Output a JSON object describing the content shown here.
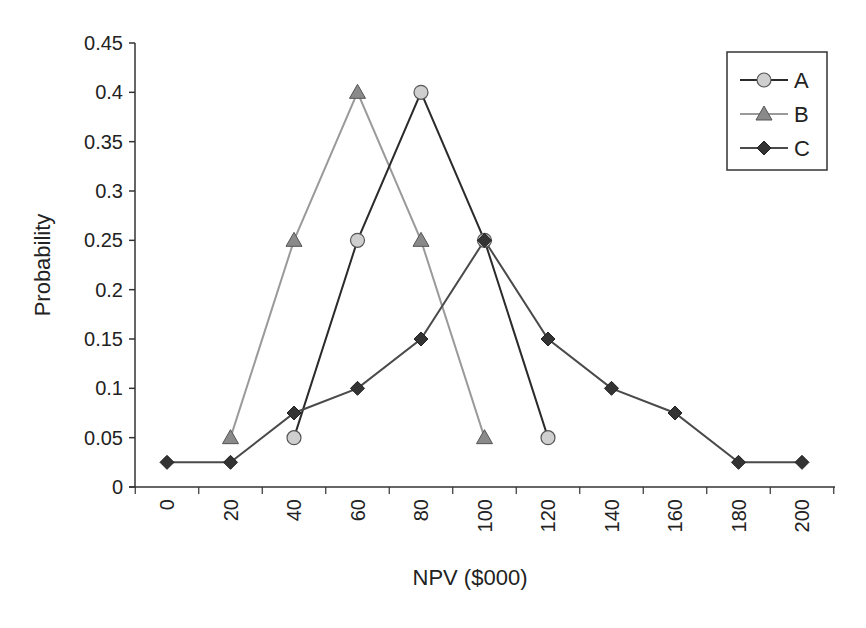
{
  "chart_data": {
    "type": "line",
    "title": "",
    "xlabel": "NPV ($000)",
    "ylabel": "Probability",
    "x": [
      0,
      20,
      40,
      60,
      80,
      100,
      120,
      140,
      160,
      180,
      200
    ],
    "xticks": [
      "0",
      "20",
      "40",
      "60",
      "80",
      "100",
      "120",
      "140",
      "160",
      "180",
      "200"
    ],
    "yticks": [
      "0",
      "0.05",
      "0.1",
      "0.15",
      "0.2",
      "0.25",
      "0.3",
      "0.35",
      "0.4",
      "0.45"
    ],
    "ylim": [
      0,
      0.45
    ],
    "xlim": [
      0,
      200
    ],
    "grid": false,
    "legend_position": "upper right",
    "series": [
      {
        "name": "A",
        "marker": "circle",
        "line_color": "#2b2b2b",
        "marker_fill": "#cfcfcf",
        "points": [
          [
            40,
            0.05
          ],
          [
            60,
            0.25
          ],
          [
            80,
            0.4
          ],
          [
            100,
            0.25
          ],
          [
            120,
            0.05
          ]
        ]
      },
      {
        "name": "B",
        "marker": "triangle",
        "line_color": "#9a9a9a",
        "marker_fill": "#8a8a8a",
        "points": [
          [
            20,
            0.05
          ],
          [
            40,
            0.25
          ],
          [
            60,
            0.4
          ],
          [
            80,
            0.25
          ],
          [
            100,
            0.05
          ]
        ]
      },
      {
        "name": "C",
        "marker": "diamond",
        "line_color": "#4a4a4a",
        "marker_fill": "#333333",
        "points": [
          [
            0,
            0.025
          ],
          [
            20,
            0.025
          ],
          [
            40,
            0.075
          ],
          [
            60,
            0.1
          ],
          [
            80,
            0.15
          ],
          [
            100,
            0.25
          ],
          [
            120,
            0.15
          ],
          [
            140,
            0.1
          ],
          [
            160,
            0.075
          ],
          [
            180,
            0.025
          ],
          [
            200,
            0.025
          ]
        ]
      }
    ]
  },
  "legend": {
    "items": [
      "A",
      "B",
      "C"
    ]
  }
}
